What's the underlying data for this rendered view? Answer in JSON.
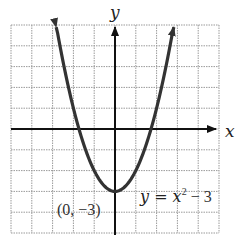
{
  "chart_data": {
    "type": "line",
    "title": "",
    "xlabel": "x",
    "ylabel": "y",
    "xlim": [
      -5,
      5
    ],
    "ylim": [
      -5,
      5
    ],
    "grid": true,
    "grid_step": 1,
    "tick_labels_shown": false,
    "series": [
      {
        "name": "y = x^2 - 3",
        "function": "y = x^2 - 3",
        "x": [
          -2.83,
          -2.5,
          -2,
          -1.5,
          -1,
          -0.5,
          0,
          0.5,
          1,
          1.5,
          2,
          2.5,
          2.83
        ],
        "values": [
          5,
          3.25,
          1,
          -0.75,
          -2,
          -2.75,
          -3,
          -2.75,
          -2,
          -0.75,
          1,
          3.25,
          5
        ],
        "arrows_at_ends": true,
        "color": "#333333"
      }
    ],
    "annotations": [
      {
        "text": "(0, −3)",
        "point": [
          0,
          -3
        ],
        "position": "below-left of vertex"
      },
      {
        "text_main": "y = x",
        "superscript": "2",
        "text_tail": " − 3",
        "position": "right of vertex"
      }
    ]
  },
  "labels": {
    "x_axis": "x",
    "y_axis": "y",
    "vertex": "(0, −3)",
    "equation_main": "y = x",
    "equation_sup": "2",
    "equation_tail": " − 3"
  },
  "colors": {
    "grid": "#9a9a9a",
    "axis": "#111111",
    "curve": "#333333",
    "background": "#ffffff"
  }
}
